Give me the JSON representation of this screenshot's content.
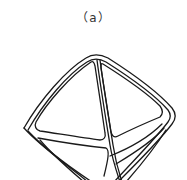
{
  "figure": {
    "label": "（a）",
    "stroke_color": "#1a1a1a",
    "background": "#ffffff"
  }
}
